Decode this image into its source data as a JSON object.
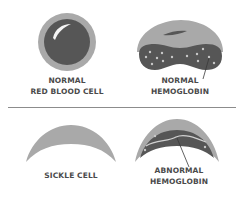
{
  "diagram": {
    "sections": [
      {
        "name": "normal",
        "items": [
          {
            "id": "normal-rbc",
            "lines": [
              "NORMAL",
              "RED BLOOD CELL"
            ]
          },
          {
            "id": "normal-hemoglobin",
            "lines": [
              "NORMAL",
              "HEMOGLOBIN"
            ]
          }
        ]
      },
      {
        "name": "sickle",
        "items": [
          {
            "id": "sickle-cell",
            "lines": [
              "SICKLE CELL"
            ]
          },
          {
            "id": "abnormal-hemoglobin",
            "lines": [
              "ABNORMAL",
              "HEMOGLOBIN"
            ]
          }
        ]
      }
    ],
    "colors": {
      "outer_gray": "#a9a9a9",
      "dark_cell": "#565656",
      "highlight": "#f4f4f4",
      "divider": "#8c8c8c",
      "text": "#4a4a4a"
    }
  }
}
